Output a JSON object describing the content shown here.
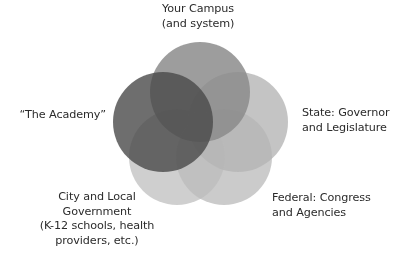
{
  "diagram": {
    "type": "venn",
    "title": "",
    "background_color": "#ffffff",
    "text_color": "#2b2b2b",
    "circles": [
      {
        "id": "campus",
        "label": "Your Campus\n(and system)",
        "label_position": "top-center",
        "cx": 200,
        "cy": 92,
        "r": 50,
        "fill": "#8c8c8c",
        "opacity": 0.85
      },
      {
        "id": "academy",
        "label": "“The Academy”",
        "label_position": "left",
        "cx": 163,
        "cy": 122,
        "r": 50,
        "fill": "#4a4a4a",
        "opacity": 0.8
      },
      {
        "id": "state",
        "label": "State: Governor\nand Legislature",
        "label_position": "right",
        "cx": 238,
        "cy": 122,
        "r": 50,
        "fill": "#b5b5b5",
        "opacity": 0.8
      },
      {
        "id": "city",
        "label": "City and Local\nGovernment\n(K-12 schools, health\nproviders, etc.)",
        "label_position": "bottom-left",
        "cx": 177,
        "cy": 157,
        "r": 48,
        "fill": "#c2c2c2",
        "opacity": 0.78
      },
      {
        "id": "federal",
        "label": "Federal: Congress\nand Agencies",
        "label_position": "bottom-right",
        "cx": 224,
        "cy": 157,
        "r": 48,
        "fill": "#bdbdbd",
        "opacity": 0.78
      }
    ]
  },
  "labels": {
    "campus": "Your Campus\n(and system)",
    "academy": "“The Academy”",
    "state": "State: Governor\nand Legislature",
    "federal": "Federal: Congress\nand Agencies",
    "city": "City and Local\nGovernment\n(K-12 schools, health\nproviders, etc.)"
  }
}
